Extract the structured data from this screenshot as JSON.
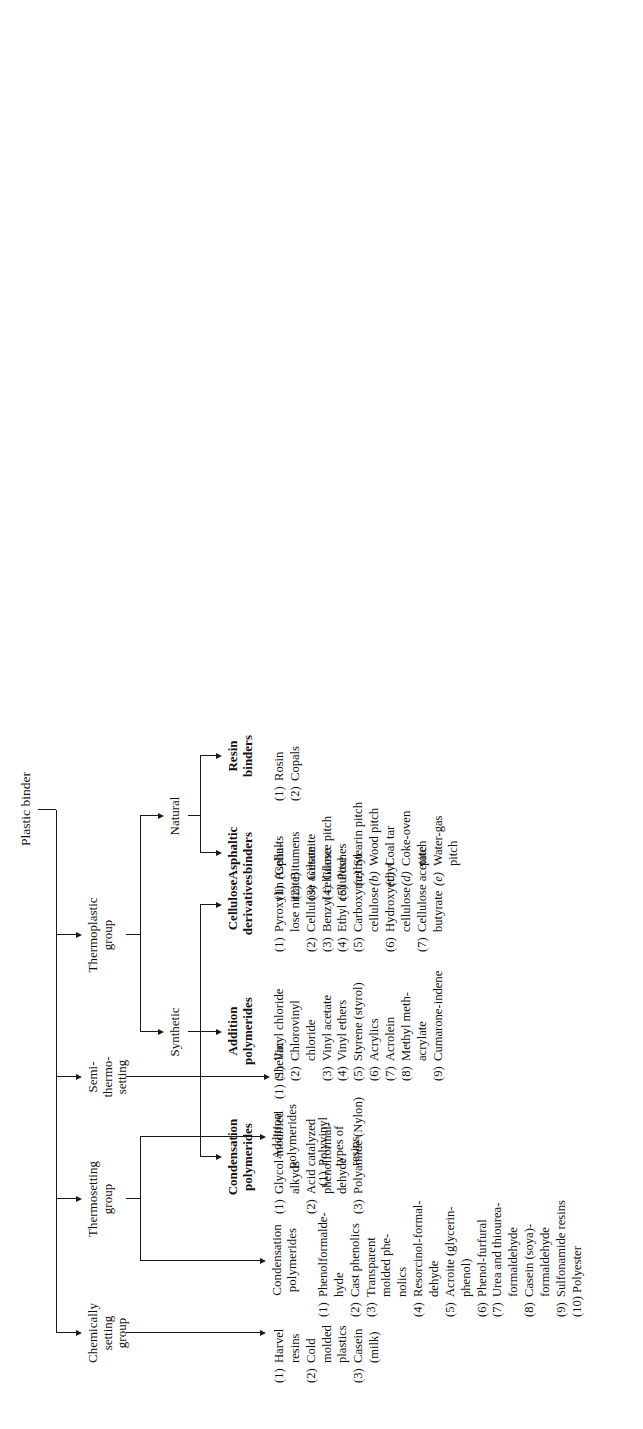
{
  "title": "Plastic binder",
  "diagram": {
    "type": "tree",
    "root": "Plastic binder",
    "level1": [
      {
        "id": "thermoplastic",
        "label": "Thermoplastic\ngroup"
      },
      {
        "id": "semi",
        "label": "Semi-\nthermo-\nsetting"
      },
      {
        "id": "thermosetting",
        "label": "Thermosetting\ngroup"
      },
      {
        "id": "chemical",
        "label": "Chemically\nsetting\ngroup"
      }
    ],
    "thermoplastic": {
      "children": [
        {
          "id": "natural",
          "label": "Natural"
        },
        {
          "id": "synthetic",
          "label": "Synthetic"
        }
      ]
    },
    "natural": {
      "children": [
        {
          "id": "resin_binders",
          "label": "Resin\nbinders"
        },
        {
          "id": "asphaltic_binders",
          "label": "Asphaltic\nbinders"
        }
      ]
    },
    "synthetic": {
      "children": [
        {
          "id": "cellulose_derivatives",
          "label": "Cellulose\nderivatives"
        },
        {
          "id": "tp_addition",
          "label": "Addition\npolymerides"
        },
        {
          "id": "tp_condensation",
          "label": "Condensation\npolymerides"
        }
      ]
    },
    "thermosetting_children": [
      {
        "id": "ts_addition",
        "label": "Addition\npolymerides"
      },
      {
        "id": "ts_condensation",
        "label": "Condensation\npolymerides"
      }
    ]
  },
  "lists": {
    "resin_binders": [
      {
        "num": "(1)",
        "text": "Rosin"
      },
      {
        "num": "(2)",
        "text": "Copals"
      }
    ],
    "asphaltic_binders": [
      {
        "num": "(1)",
        "text": "Asphalts"
      },
      {
        "num": "(2)",
        "text": "Bitumens"
      },
      {
        "num": "(3)",
        "text": "Gilsonite"
      },
      {
        "num": "(4)",
        "text": "Glance pitch"
      },
      {
        "num": "(5)",
        "text": "Pitches"
      }
    ],
    "asphaltic_pitches": [
      {
        "num": "(a)",
        "text": "Stearin pitch"
      },
      {
        "num": "(b)",
        "text": "Wood pitch"
      },
      {
        "num": "(c)",
        "text": "Coal tar"
      },
      {
        "num": "(d)",
        "text": "Coke-oven\n   pitch"
      },
      {
        "num": "(e)",
        "text": "Water-gas\n   pitch"
      }
    ],
    "cellulose_derivatives": [
      {
        "num": "(1)",
        "text": "Pyroxylin (Cellu-\n   lose nitrate)"
      },
      {
        "num": "(2)",
        "text": "Cellulose acetate"
      },
      {
        "num": "(3)",
        "text": "Benzyl cellulose"
      },
      {
        "num": "(4)",
        "text": "Ethyl cellulose"
      },
      {
        "num": "(5)",
        "text": "Carboxymethyl\n   cellulose"
      },
      {
        "num": "(6)",
        "text": "Hydroxyethyl\n   cellulose"
      },
      {
        "num": "(7)",
        "text": "Cellulose acetate\n   butyrate"
      }
    ],
    "tp_addition": [
      {
        "num": "(1)",
        "text": "Vinyl chloride"
      },
      {
        "num": "(2)",
        "text": "Chlorovinyl\n   chloride"
      },
      {
        "num": "(3)",
        "text": "Vinyl acetate"
      },
      {
        "num": "(4)",
        "text": "Vinyl ethers"
      },
      {
        "num": "(5)",
        "text": "Styrene (styrol)"
      },
      {
        "num": "(6)",
        "text": "Acrylics"
      },
      {
        "num": "(7)",
        "text": "Acrolein"
      },
      {
        "num": "(8)",
        "text": "Methyl meth-\n   acrylate"
      },
      {
        "num": "(9)",
        "text": "Cumarone-indene"
      }
    ],
    "tp_condensation": [
      {
        "num": "(1)",
        "text": "Glycol modified\n   alkyds"
      },
      {
        "num": "(2)",
        "text": "Acid catalyzed\n   phenolformal-\n   dehyde"
      },
      {
        "num": "(3)",
        "text": "Polyamide (Nylon)"
      }
    ],
    "semi": [
      {
        "num": "(1)",
        "text": "Shellac"
      }
    ],
    "ts_addition": [
      {
        "num": "(1)",
        "text": "Polyvinyl\n   types of\n   resins"
      }
    ],
    "ts_condensation": [
      {
        "num": "(1)",
        "text": "Phenolformalde-\n   hyde"
      },
      {
        "num": "(2)",
        "text": "Cast phenolics"
      },
      {
        "num": "(3)",
        "text": "Transparent\n   molded phe-\n   nolics"
      },
      {
        "num": "(4)",
        "text": "Resorcinol-formal-\n   dehyde"
      },
      {
        "num": "(5)",
        "text": "Acroite (glycerin-\n   phenol)"
      },
      {
        "num": "(6)",
        "text": "Phenol-furfural"
      },
      {
        "num": "(7)",
        "text": "Urea and thiourea-\n   formaldehyde"
      },
      {
        "num": "(8)",
        "text": "Casein (soya)-\n   formaldehyde"
      },
      {
        "num": "(9)",
        "text": "Sulfonamide resins"
      },
      {
        "num": "(10)",
        "text": "Polyester"
      }
    ],
    "chemical": [
      {
        "num": "(1)",
        "text": "Harvel\n   resins"
      },
      {
        "num": "(2)",
        "text": "Cold\n   molded\n   plastics"
      },
      {
        "num": "(3)",
        "text": "Casein\n   (milk)"
      }
    ]
  }
}
